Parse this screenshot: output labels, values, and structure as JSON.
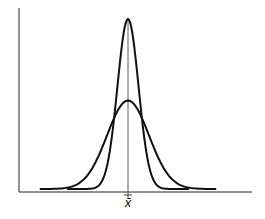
{
  "chart_data": {
    "type": "line",
    "title": "",
    "xlabel": "",
    "ylabel": "",
    "tick_labels": {
      "x": [
        "x̄"
      ]
    },
    "grid": false,
    "legend": null,
    "series": [
      {
        "name": "narrow distribution (small spread)",
        "mean": 0,
        "relative_sd": 0.5,
        "relative_peak": 1.0,
        "x_extent": [
          -2.9,
          2.9
        ]
      },
      {
        "name": "wide distribution (large spread)",
        "mean": 0,
        "relative_sd": 1.0,
        "relative_peak": 0.52,
        "x_extent": [
          -4.2,
          4.2
        ]
      }
    ],
    "annotations": [
      {
        "text": "x̄",
        "position": "below x-axis at mean",
        "note": "vertical line drawn at the mean"
      }
    ]
  },
  "labels": {
    "mean": "x̄"
  },
  "colors": {
    "curve": "#111111",
    "axis": "#222222",
    "background": "#ffffff"
  }
}
